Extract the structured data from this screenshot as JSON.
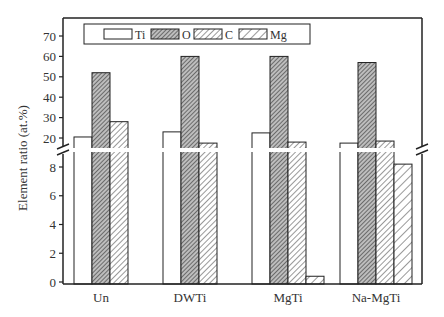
{
  "chart_data": {
    "type": "bar",
    "title": "",
    "xlabel": "",
    "ylabel": "Element ratio (at.%)",
    "categories": [
      "Un",
      "DWTi",
      "MgTi",
      "Na-MgTi"
    ],
    "series": [
      {
        "name": "Ti",
        "pattern": "open",
        "values": [
          20.5,
          23,
          22.5,
          17.5
        ]
      },
      {
        "name": "O",
        "pattern": "dense-hatch",
        "values": [
          52,
          60,
          60,
          57
        ]
      },
      {
        "name": "C",
        "pattern": "hatch",
        "values": [
          28,
          17.5,
          18,
          18.5
        ]
      },
      {
        "name": "Mg",
        "pattern": "wide-hatch",
        "values": [
          0,
          0,
          0.4,
          8.2
        ]
      }
    ],
    "axis_break": true,
    "lower_ylim": [
      0,
      9
    ],
    "lower_yticks": [
      "0",
      "2",
      "4",
      "6",
      "8"
    ],
    "upper_ylim": [
      17,
      73
    ],
    "upper_yticks": [
      "20",
      "30",
      "40",
      "50",
      "60",
      "70"
    ],
    "legend": {
      "position": "top-inside",
      "entries": [
        "Ti",
        "O",
        "C",
        "Mg"
      ]
    },
    "grid": false
  }
}
